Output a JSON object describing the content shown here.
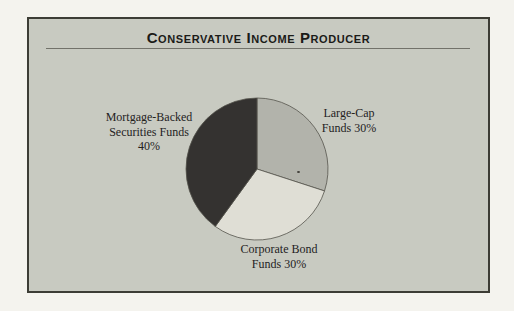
{
  "panel": {
    "title": "Conservative Income Producer"
  },
  "chart_data": {
    "type": "pie",
    "title": "Conservative Income Producer",
    "start_angle_deg": -90,
    "direction": "clockwise",
    "legend_position": "callout-labels",
    "slices": [
      {
        "id": "large-cap",
        "label": "Large-Cap Funds",
        "value": 30,
        "unit": "%",
        "color": "#b2b3ab",
        "label_lines": [
          "Large-Cap",
          "Funds 30%"
        ]
      },
      {
        "id": "corporate-bond",
        "label": "Corporate Bond Funds",
        "value": 30,
        "unit": "%",
        "color": "#dfded5",
        "label_lines": [
          "Corporate Bond",
          "Funds 30%"
        ]
      },
      {
        "id": "mortgage-backed",
        "label": "Mortgage-Backed Securities Funds",
        "value": 40,
        "unit": "%",
        "color": "#343230",
        "label_lines": [
          "Mortgage-Backed",
          "Securities Funds",
          "40%"
        ]
      }
    ],
    "outline_color": "#55544c",
    "panel_background": "#c8cac1",
    "page_background": "#f4f3ee",
    "border_color": "#3c3c35"
  }
}
